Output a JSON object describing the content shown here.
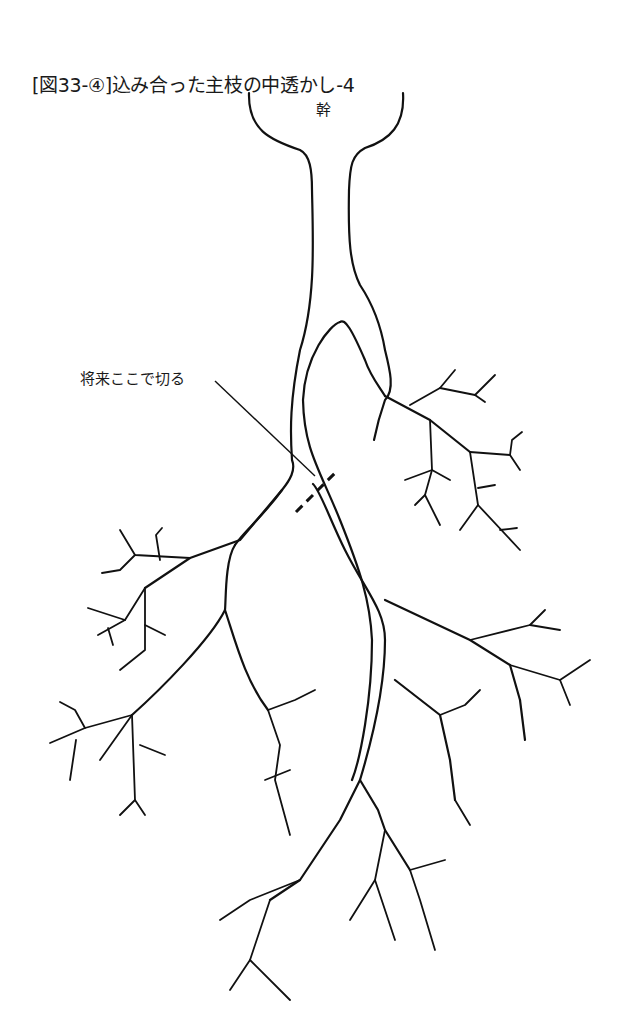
{
  "figure": {
    "title": "[図33-④]込み合った主枝の中透かし-4",
    "labels": {
      "trunk": "幹",
      "cut_annotation": "将来ここで切る"
    },
    "colors": {
      "background": "#ffffff",
      "line": "#111111"
    }
  }
}
